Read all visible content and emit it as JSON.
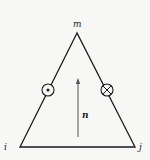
{
  "diagram": {
    "type": "triangle-element",
    "vertices": [
      {
        "id": "m",
        "label": "m",
        "position": "top"
      },
      {
        "id": "i",
        "label": "i",
        "position": "bottom-left"
      },
      {
        "id": "j",
        "label": "j",
        "position": "bottom-right"
      }
    ],
    "symbols": [
      {
        "id": "out-of-page",
        "glyph": "dot-in-circle",
        "edge": "i-m"
      },
      {
        "id": "into-page",
        "glyph": "cross-in-circle",
        "edge": "j-m"
      }
    ],
    "vector": {
      "label": "n",
      "direction": "up"
    },
    "colors": {
      "stroke": "#1a1a1a",
      "arrow": "#555555",
      "background": "#f7f7f5"
    }
  }
}
